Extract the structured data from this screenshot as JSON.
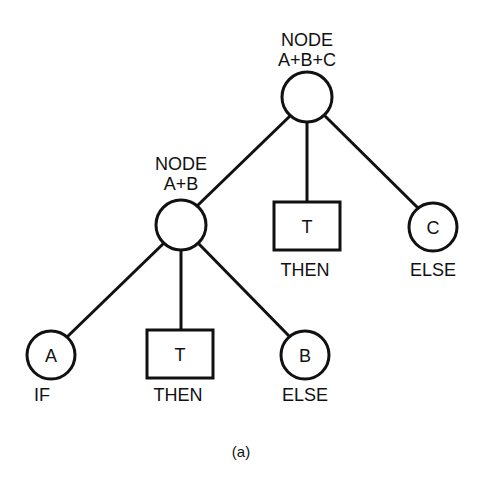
{
  "diagram": {
    "caption": "(a)",
    "nodes": {
      "root": {
        "label_line1": "NODE",
        "label_line2": "A+B+C"
      },
      "ab": {
        "label_line1": "NODE",
        "label_line2": "A+B"
      },
      "t_top": {
        "symbol": "T",
        "role": "THEN"
      },
      "c": {
        "symbol": "C",
        "role": "ELSE"
      },
      "a": {
        "symbol": "A",
        "role": "IF"
      },
      "t_bottom": {
        "symbol": "T",
        "role": "THEN"
      },
      "b": {
        "symbol": "B",
        "role": "ELSE"
      }
    }
  }
}
